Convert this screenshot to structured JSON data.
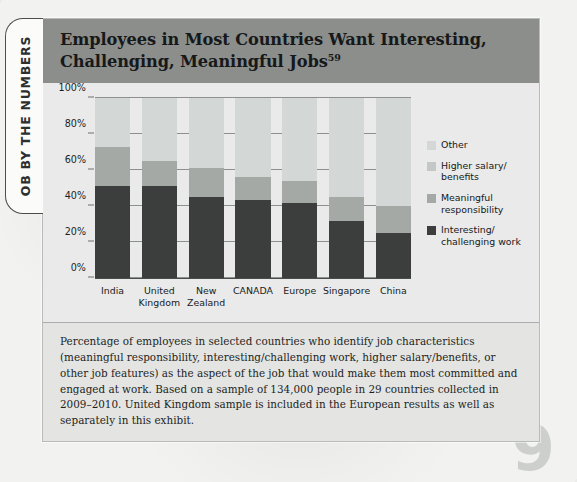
{
  "side_tab": {
    "label": "OB BY THE NUMBERS"
  },
  "page_number": "9",
  "exhibit": {
    "title_line1": "Employees in Most Countries Want Interesting,",
    "title_line2": "Challenging, Meaningful Jobs",
    "title_superscript": "59",
    "caption": "Percentage of employees in selected countries who identify job characteristics (meaningful responsibility, interesting/challenging work, higher salary/benefits, or other job features) as the aspect of the job that would make them most committed and engaged at work. Based on a sample of 134,000 people in 29 countries collected in 2009–2010. United Kingdom sample is included in the European results as well as separately in this exhibit."
  },
  "colors": {
    "title_band": "#8b8e8b",
    "other": "#d3d7d5",
    "higher_salary": "#c3c7c5",
    "meaningful": "#a5a9a6",
    "interesting": "#3c3e3d"
  },
  "chart_data": {
    "type": "bar",
    "stacked": true,
    "stacked_total": 100,
    "title": "Employees in Most Countries Want Interesting, Challenging, Meaningful Jobs",
    "xlabel": "",
    "ylabel": "",
    "ylim": [
      0,
      100
    ],
    "ytick_labels": [
      "0%",
      "20%",
      "40%",
      "60%",
      "80%",
      "100%"
    ],
    "ytick_values": [
      0,
      20,
      40,
      60,
      80,
      100
    ],
    "grid": true,
    "legend_position": "right",
    "categories": [
      "India",
      "United Kingdom",
      "New Zealand",
      "CANADA",
      "Europe",
      "Singapore",
      "China"
    ],
    "category_lines": [
      [
        "India"
      ],
      [
        "United",
        "Kingdom"
      ],
      [
        "New",
        "Zealand"
      ],
      [
        "CANADA"
      ],
      [
        "Europe"
      ],
      [
        "Singapore"
      ],
      [
        "China"
      ]
    ],
    "series": [
      {
        "name": "Interesting/challenging work",
        "legend_lines": [
          "Interesting/",
          "challenging work"
        ],
        "color": "#3c3e3d",
        "values": [
          51,
          51,
          45,
          43.5,
          42,
          32,
          25
        ]
      },
      {
        "name": "Meaningful responsibility",
        "legend_lines": [
          "Meaningful",
          "responsibility"
        ],
        "color": "#a5a9a6",
        "values": [
          22,
          14,
          16,
          12.5,
          12,
          13,
          15
        ]
      },
      {
        "name": "Higher salary/benefits",
        "legend_lines": [
          "Higher salary/",
          "benefits"
        ],
        "color": "#c3c7c5",
        "values": [
          0,
          0,
          0,
          0,
          0,
          0,
          0
        ]
      },
      {
        "name": "Other",
        "legend_lines": [
          "Other"
        ],
        "color": "#d3d7d5",
        "values": [
          27,
          35,
          39,
          44,
          46,
          55,
          60
        ]
      }
    ],
    "cumulative_tops": {
      "interesting": [
        51,
        51,
        45,
        43.5,
        42,
        32,
        25
      ],
      "meaningful": [
        73,
        65,
        61,
        56,
        54,
        45,
        40
      ],
      "total": [
        100,
        100,
        100,
        100,
        100,
        100,
        100
      ]
    }
  },
  "legend": [
    {
      "label": "Other",
      "color": "#d3d7d5"
    },
    {
      "label": "Higher salary/ benefits",
      "color": "#c3c7c5"
    },
    {
      "label": "Meaningful responsibility",
      "color": "#a5a9a6"
    },
    {
      "label": "Interesting/ challenging work",
      "color": "#3c3e3d"
    }
  ]
}
